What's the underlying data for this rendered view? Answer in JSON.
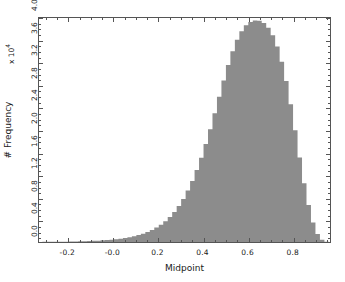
{
  "figure": {
    "background_color": "#ffffff",
    "axes_color": "#555555",
    "fill_color": "#8c8c8c"
  },
  "axis_titles": {
    "x": "Midpoint",
    "y": "# Frequency"
  },
  "y_exponent_label": "x 10",
  "y_exponent_power": "4",
  "x_ticks": [
    "-0.2",
    "-0.0",
    "0.2",
    "0.4",
    "0.6",
    "0.8"
  ],
  "y_ticks": [
    "0.0",
    "0.4",
    "0.8",
    "1.2",
    "1.6",
    "2.0",
    "2.4",
    "2.8",
    "3.2",
    "3.6",
    "4.0"
  ],
  "chart_data": {
    "type": "bar",
    "title": "",
    "subtitle": "",
    "xlabel": "Midpoint",
    "ylabel": "# Frequency",
    "y_scale_multiplier": 10000,
    "y_exponent_text": "x 10^4",
    "xlim": [
      -0.33,
      0.97
    ],
    "ylim": [
      0,
      40000
    ],
    "xticks": [
      -0.2,
      -0.0,
      0.2,
      0.4,
      0.6,
      0.8
    ],
    "yticks": [
      0,
      4000,
      8000,
      12000,
      16000,
      20000,
      24000,
      28000,
      32000,
      36000,
      40000
    ],
    "grid": false,
    "legend": null,
    "legend_position": "none",
    "annotations": [],
    "bar_fill_color": "#8c8c8c",
    "bar_edge_color": "#8c8c8c",
    "categories": [
      -0.325,
      -0.305,
      -0.285,
      -0.265,
      -0.245,
      -0.225,
      -0.205,
      -0.185,
      -0.165,
      -0.145,
      -0.125,
      -0.105,
      -0.085,
      -0.065,
      -0.045,
      -0.025,
      -0.005,
      0.015,
      0.035,
      0.055,
      0.075,
      0.095,
      0.115,
      0.135,
      0.155,
      0.175,
      0.195,
      0.215,
      0.235,
      0.255,
      0.275,
      0.295,
      0.315,
      0.335,
      0.355,
      0.375,
      0.395,
      0.415,
      0.435,
      0.455,
      0.475,
      0.495,
      0.515,
      0.535,
      0.555,
      0.575,
      0.595,
      0.615,
      0.635,
      0.655,
      0.675,
      0.695,
      0.715,
      0.735,
      0.755,
      0.775,
      0.795,
      0.815,
      0.835,
      0.855,
      0.875,
      0.895,
      0.915,
      0.935,
      0.955
    ],
    "values": [
      20,
      25,
      30,
      35,
      45,
      55,
      65,
      80,
      95,
      115,
      140,
      170,
      205,
      245,
      295,
      350,
      420,
      500,
      600,
      720,
      860,
      1030,
      1240,
      1490,
      1790,
      2150,
      2580,
      3100,
      3720,
      4470,
      5360,
      6430,
      7700,
      9180,
      10900,
      12850,
      15050,
      17500,
      20150,
      23000,
      25950,
      28850,
      31600,
      34050,
      36100,
      37650,
      38700,
      39300,
      39550,
      39500,
      39100,
      38250,
      36900,
      34900,
      32200,
      28750,
      24600,
      19950,
      15100,
      10500,
      6600,
      3500,
      1450,
      400,
      40
    ]
  }
}
